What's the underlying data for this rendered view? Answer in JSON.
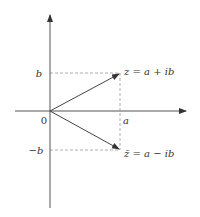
{
  "diagram": {
    "colors": {
      "axis": "#444444",
      "vector": "#444444",
      "guide": "#999999",
      "text": "#333333"
    },
    "axes": {
      "origin_label": "0",
      "x_tick_label": "a",
      "y_tick_pos_label": "b",
      "y_tick_neg_label": "−b"
    },
    "points": [
      {
        "name": "z",
        "label": "z = a + ib"
      },
      {
        "name": "z-conjugate",
        "label": "z̄ = a − ib"
      }
    ]
  }
}
